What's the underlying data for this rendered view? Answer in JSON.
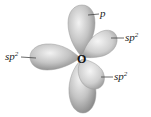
{
  "diagram": {
    "type": "orbital-diagram",
    "atom": {
      "symbol": "O"
    },
    "orbitals": [
      {
        "id": "p-top",
        "label": "p"
      },
      {
        "id": "sp2-upper-right",
        "label": "sp",
        "superscript": "2"
      },
      {
        "id": "sp2-left",
        "label": "sp",
        "superscript": "2"
      },
      {
        "id": "sp2-lower-right",
        "label": "sp",
        "superscript": "2"
      }
    ],
    "colors": {
      "lobe_light": "#e4e4e4",
      "lobe_dark": "#8e8e8e",
      "label": "#222222"
    }
  }
}
